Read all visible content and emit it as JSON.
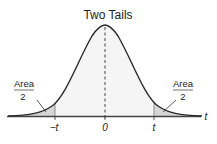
{
  "title": "Two Tails",
  "left_label": {
    "top": "Area",
    "bottom": "2"
  },
  "right_label": {
    "top": "Area",
    "bottom": "2"
  },
  "ticks": {
    "neg": "−t",
    "zero": "0",
    "pos": "t"
  },
  "axis_label": "t",
  "colors": {
    "curve": "#2b2b2b",
    "fill": "#f4f4f4",
    "tail_fill": "#d9d9d9",
    "axis": "#444444"
  }
}
